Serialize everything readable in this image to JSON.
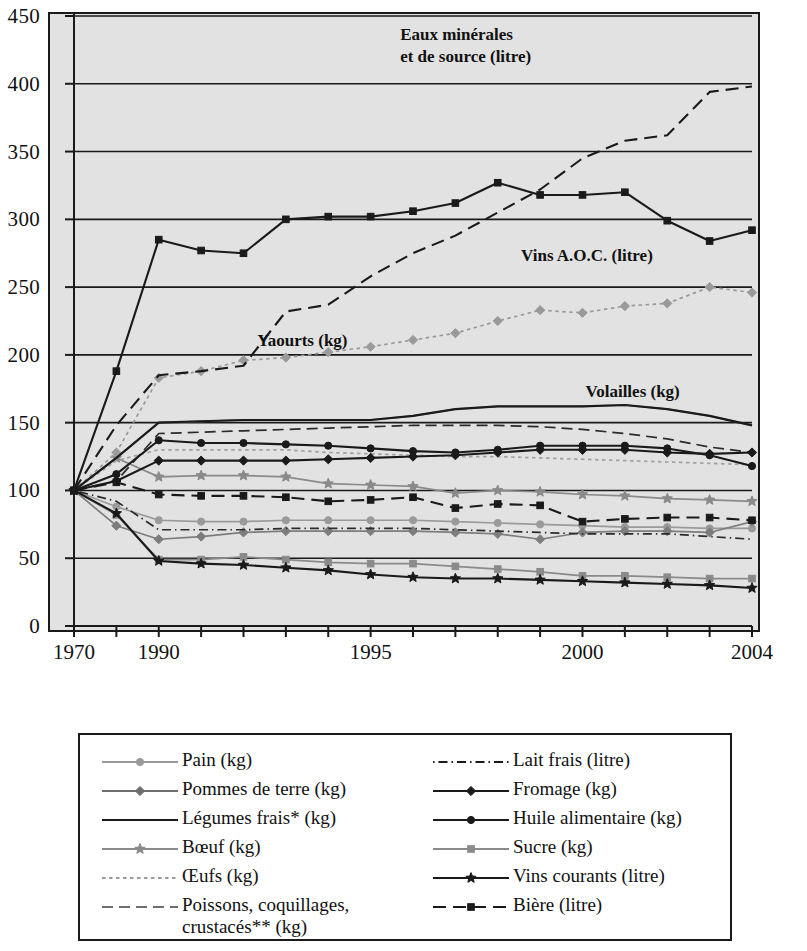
{
  "chart_data": {
    "type": "line",
    "title": "",
    "xlabel": "",
    "ylabel": "",
    "ylim": [
      0,
      450
    ],
    "ytick_step": 50,
    "grid": true,
    "plot_background": "#e2e2e2",
    "x": [
      1970,
      1980,
      1990,
      1991,
      1992,
      1993,
      1994,
      1995,
      1996,
      1997,
      1998,
      1999,
      2000,
      2001,
      2002,
      2003,
      2004
    ],
    "x_tick_labels": [
      "1970",
      "",
      "1990",
      "",
      "",
      "",
      "",
      "1995",
      "",
      "",
      "",
      "",
      "2000",
      "",
      "",
      "",
      "2004"
    ],
    "y_tick_labels": [
      "0",
      "50",
      "100",
      "150",
      "200",
      "250",
      "300",
      "350",
      "400",
      "450"
    ],
    "legend_position": "below-plot",
    "series": [
      {
        "name": "Pain (kg)",
        "unit": "kg",
        "color": "#9a9a9a",
        "style": "solid",
        "marker": "circle",
        "values": [
          100,
          88,
          78,
          77,
          77,
          78,
          78,
          78,
          78,
          77,
          76,
          75,
          74,
          73,
          73,
          72,
          72
        ]
      },
      {
        "name": "Pommes de terre (kg)",
        "unit": "kg",
        "color": "#7d7d7d",
        "style": "solid",
        "marker": "diamond",
        "values": [
          100,
          74,
          64,
          66,
          69,
          70,
          70,
          70,
          70,
          69,
          68,
          64,
          69,
          70,
          70,
          69,
          77
        ]
      },
      {
        "name": "Légumes frais* (kg)",
        "unit": "kg",
        "color": "#1a1a1a",
        "style": "solid",
        "marker": "none",
        "values": [
          100,
          124,
          150,
          151,
          152,
          152,
          152,
          152,
          155,
          160,
          162,
          162,
          162,
          163,
          160,
          155,
          148
        ]
      },
      {
        "name": "Bœuf (kg)",
        "unit": "kg",
        "color": "#8a8a8a",
        "style": "solid",
        "marker": "star",
        "values": [
          100,
          124,
          110,
          111,
          111,
          110,
          105,
          104,
          103,
          98,
          100,
          99,
          97,
          96,
          94,
          93,
          92
        ]
      },
      {
        "name": "Œufs (kg)",
        "unit": "kg",
        "color": "#a0a0a0",
        "style": "dotted",
        "marker": "none",
        "values": [
          100,
          122,
          130,
          130,
          130,
          130,
          128,
          127,
          126,
          125,
          125,
          124,
          123,
          122,
          121,
          120,
          119
        ]
      },
      {
        "name": "Poissons, coquillages, crustacés** (kg)",
        "unit": "kg",
        "color": "#2b2b2b",
        "style": "dashed",
        "marker": "none",
        "values": [
          100,
          107,
          142,
          143,
          144,
          145,
          146,
          147,
          148,
          148,
          148,
          147,
          145,
          142,
          138,
          132,
          128
        ]
      },
      {
        "name": "Lait frais (litre)",
        "unit": "litre",
        "color": "#2b2b2b",
        "style": "dashdot",
        "marker": "none",
        "values": [
          100,
          92,
          71,
          71,
          71,
          72,
          72,
          72,
          72,
          71,
          70,
          69,
          68,
          68,
          68,
          66,
          64
        ]
      },
      {
        "name": "Fromage (kg)",
        "unit": "kg",
        "color": "#1a1a1a",
        "style": "solid",
        "marker": "diamond-filled",
        "values": [
          100,
          107,
          122,
          122,
          122,
          122,
          123,
          124,
          125,
          126,
          128,
          130,
          130,
          130,
          128,
          127,
          128
        ]
      },
      {
        "name": "Huile alimentaire (kg)",
        "unit": "kg",
        "color": "#1a1a1a",
        "style": "solid",
        "marker": "circle-filled",
        "values": [
          100,
          112,
          137,
          135,
          135,
          134,
          133,
          131,
          129,
          128,
          130,
          133,
          133,
          133,
          131,
          126,
          118
        ]
      },
      {
        "name": "Sucre (kg)",
        "unit": "kg",
        "color": "#8a8a8a",
        "style": "solid",
        "marker": "square",
        "values": [
          100,
          82,
          49,
          49,
          51,
          49,
          47,
          46,
          46,
          44,
          42,
          40,
          37,
          37,
          36,
          35,
          35
        ]
      },
      {
        "name": "Vins courants (litre)",
        "unit": "litre",
        "color": "#1a1a1a",
        "style": "solid",
        "marker": "star-filled",
        "values": [
          100,
          83,
          48,
          46,
          45,
          43,
          41,
          38,
          36,
          35,
          35,
          34,
          33,
          32,
          31,
          30,
          28
        ]
      },
      {
        "name": "Bière (litre)",
        "unit": "litre",
        "color": "#1a1a1a",
        "style": "dashed",
        "marker": "square-filled",
        "values": [
          100,
          106,
          97,
          96,
          96,
          95,
          92,
          93,
          95,
          87,
          90,
          89,
          77,
          79,
          80,
          80,
          78
        ]
      },
      {
        "name": "Eaux minérales et de source (litre)",
        "unit": "litre",
        "color": "#1a1a1a",
        "style": "dashed",
        "marker": "none",
        "values": [
          100,
          148,
          185,
          188,
          192,
          232,
          237,
          258,
          275,
          288,
          305,
          322,
          345,
          358,
          362,
          394,
          398
        ]
      },
      {
        "name": "Vins A.O.C. (litre)",
        "unit": "litre",
        "color": "#1a1a1a",
        "style": "solid",
        "marker": "square-filled",
        "values": [
          100,
          188,
          285,
          277,
          275,
          300,
          302,
          302,
          306,
          312,
          327,
          318,
          318,
          320,
          299,
          284,
          292
        ]
      },
      {
        "name": "Yaourts (kg)",
        "unit": "kg",
        "color": "#9a9a9a",
        "style": "dotted",
        "marker": "diamond",
        "values": [
          100,
          128,
          183,
          188,
          196,
          198,
          202,
          206,
          211,
          216,
          225,
          233,
          231,
          236,
          238,
          250,
          246
        ]
      },
      {
        "name": "Volailles (kg)",
        "unit": "kg",
        "color": "#8a8a8a",
        "style": "solid",
        "marker": "none",
        "values": [
          100,
          124,
          150,
          151,
          152,
          152,
          152,
          152,
          155,
          160,
          162,
          162,
          162,
          163,
          160,
          155,
          148
        ]
      }
    ],
    "annotations": [
      {
        "id": "eaux",
        "line1": "Eaux minérales",
        "line2": "et de source (litre)"
      },
      {
        "id": "vins-aoc",
        "text": "Vins A.O.C. (litre)"
      },
      {
        "id": "yaourts",
        "text": "Yaourts (kg)"
      },
      {
        "id": "volailles",
        "text": "Volailles (kg)"
      }
    ]
  },
  "legend": {
    "left": [
      {
        "label": "Pain (kg)",
        "style": "solid",
        "color": "#9a9a9a",
        "marker": "circle"
      },
      {
        "label": "Pommes de terre (kg)",
        "style": "solid",
        "color": "#6e6e6e",
        "marker": "diamond"
      },
      {
        "label": "Légumes frais* (kg)",
        "style": "solid",
        "color": "#1a1a1a",
        "marker": "none"
      },
      {
        "label": "Bœuf (kg)",
        "style": "solid",
        "color": "#8a8a8a",
        "marker": "star"
      },
      {
        "label": "Œufs (kg)",
        "style": "dotted",
        "color": "#9a9a9a",
        "marker": "none"
      },
      {
        "label": "Poissons, coquillages,",
        "label2": "crustacés** (kg)",
        "style": "dashed",
        "color": "#6e6e6e",
        "marker": "none"
      }
    ],
    "right": [
      {
        "label": "Lait frais (litre)",
        "style": "dashdot",
        "color": "#1a1a1a",
        "marker": "none"
      },
      {
        "label": "Fromage (kg)",
        "style": "solid",
        "color": "#1a1a1a",
        "marker": "diamond-filled"
      },
      {
        "label": "Huile alimentaire (kg)",
        "style": "solid",
        "color": "#1a1a1a",
        "marker": "circle-filled"
      },
      {
        "label": "Sucre (kg)",
        "style": "solid",
        "color": "#8a8a8a",
        "marker": "square"
      },
      {
        "label": "Vins courants (litre)",
        "style": "solid",
        "color": "#1a1a1a",
        "marker": "star-filled"
      },
      {
        "label": "Bière (litre)",
        "style": "dashed",
        "color": "#1a1a1a",
        "marker": "square-filled"
      }
    ]
  }
}
